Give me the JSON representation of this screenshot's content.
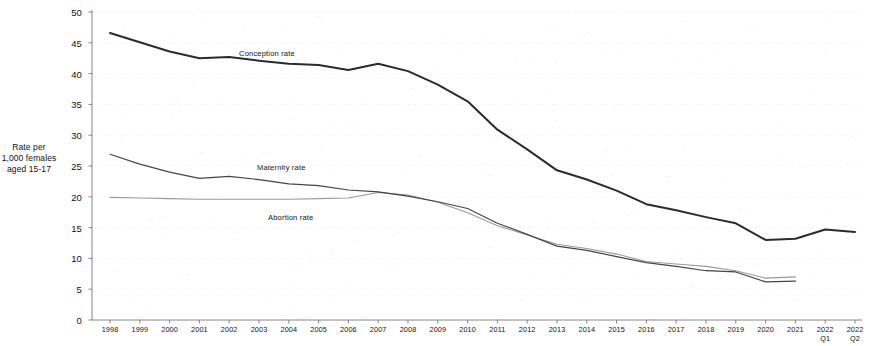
{
  "chart_data": {
    "type": "line",
    "title": "",
    "xlabel": "",
    "ylabel": "Rate per\n1,000 females\naged 15-17",
    "ylim": [
      0,
      50
    ],
    "yticks": [
      0,
      5,
      10,
      15,
      20,
      25,
      30,
      35,
      40,
      45,
      50
    ],
    "grid": true,
    "legend_position": "inline-labels",
    "categories": [
      "1998",
      "1999",
      "2000",
      "2001",
      "2002",
      "2003",
      "2004",
      "2005",
      "2006",
      "2007",
      "2008",
      "2009",
      "2010",
      "2011",
      "2012",
      "2013",
      "2014",
      "2015",
      "2016",
      "2017",
      "2018",
      "2019",
      "2020",
      "2021",
      "2022\nQ1",
      "2022\nQ2"
    ],
    "series": [
      {
        "name": "Conception rate",
        "color": "#2b2b2b",
        "values": [
          46.6,
          45.1,
          43.6,
          42.5,
          42.7,
          42.1,
          41.6,
          41.4,
          40.6,
          41.6,
          40.4,
          38.2,
          35.5,
          30.9,
          27.7,
          24.3,
          22.8,
          21.0,
          18.8,
          17.8,
          16.7,
          15.7,
          13.0,
          13.2,
          14.7,
          14.3
        ]
      },
      {
        "name": "Maternity rate",
        "color": "#454545",
        "values": [
          26.9,
          25.3,
          24.0,
          23.0,
          23.3,
          22.8,
          22.1,
          21.8,
          21.1,
          20.8,
          20.1,
          19.2,
          18.1,
          15.7,
          13.9,
          12.0,
          11.3,
          10.3,
          9.3,
          8.7,
          8.0,
          7.8,
          6.2,
          6.3,
          null,
          null
        ]
      },
      {
        "name": "Abortion rate",
        "color": "#9a9a9a",
        "values": [
          19.9,
          19.8,
          19.7,
          19.6,
          19.6,
          19.6,
          19.6,
          19.7,
          19.8,
          20.7,
          20.3,
          19.1,
          17.4,
          15.3,
          13.8,
          12.3,
          11.6,
          10.7,
          9.5,
          9.1,
          8.7,
          8.0,
          6.8,
          7.0,
          null,
          null
        ]
      }
    ],
    "series_label_positions": [
      {
        "name": "Conception rate",
        "x": 239,
        "y": 49
      },
      {
        "name": "Maternity rate",
        "x": 257,
        "y": 163
      },
      {
        "name": "Abortion rate",
        "x": 268,
        "y": 213
      }
    ]
  }
}
